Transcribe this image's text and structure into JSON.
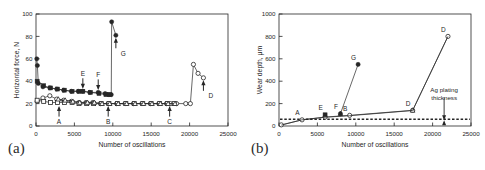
{
  "figure": {
    "panel_a_tag": "(a)",
    "panel_b_tag": "(b)"
  },
  "chart_data": [
    {
      "type": "line",
      "panel": "(a)",
      "title": "",
      "xlabel": "Number of oscillations",
      "ylabel": "Horizontal force, N",
      "xlim": [
        0,
        25000
      ],
      "ylim": [
        0,
        100
      ],
      "xticks": [
        0,
        5000,
        10000,
        15000,
        20000,
        25000
      ],
      "xticklabels": [
        "0",
        "5000",
        "10000",
        "15000",
        "20000",
        "25000"
      ],
      "yticks": [
        0,
        20,
        40,
        60,
        80,
        100
      ],
      "yticklabels": [
        "0",
        "20",
        "40",
        "60",
        "80",
        "100"
      ],
      "grid": false,
      "legend": "none",
      "annotations": [
        {
          "label": "A",
          "x": 3000,
          "y": 20,
          "arrow": "up"
        },
        {
          "label": "B",
          "x": 9400,
          "y": 20,
          "arrow": "up"
        },
        {
          "label": "C",
          "x": 17400,
          "y": 20,
          "arrow": "up"
        },
        {
          "label": "D",
          "x": 21800,
          "y": 43,
          "arrow": "up"
        },
        {
          "label": "E",
          "x": 6100,
          "y": 31,
          "arrow": "down"
        },
        {
          "label": "F",
          "x": 8100,
          "y": 30,
          "arrow": "down"
        },
        {
          "label": "G",
          "x": 10400,
          "y": 81,
          "arrow": "up"
        }
      ],
      "series": [
        {
          "name": "filled-circle-series",
          "marker": "filled-circle",
          "points": [
            [
              100,
              60
            ],
            [
              180,
              54
            ],
            [
              300,
              38
            ],
            [
              900,
              35
            ],
            [
              1800,
              34
            ],
            [
              2700,
              33
            ],
            [
              3600,
              32
            ],
            [
              4600,
              31
            ],
            [
              5500,
              31
            ],
            [
              6100,
              31
            ],
            [
              7000,
              30
            ],
            [
              8100,
              30
            ],
            [
              9000,
              29
            ],
            [
              9500,
              28
            ],
            [
              9800,
              28
            ],
            [
              9850,
              93
            ],
            [
              10400,
              81
            ]
          ]
        },
        {
          "name": "filled-square-series",
          "marker": "filled-square",
          "points": [
            [
              150,
              40
            ],
            [
              1000,
              36
            ],
            [
              1900,
              34
            ],
            [
              2800,
              33
            ],
            [
              3700,
              32
            ],
            [
              4700,
              31
            ],
            [
              5600,
              31
            ],
            [
              6100,
              31
            ],
            [
              7100,
              30
            ],
            [
              8200,
              29
            ],
            [
              9100,
              28
            ],
            [
              9600,
              28
            ]
          ]
        },
        {
          "name": "open-circle-series",
          "marker": "open-circle",
          "points": [
            [
              150,
              22
            ],
            [
              900,
              25
            ],
            [
              1800,
              27
            ],
            [
              2700,
              24
            ],
            [
              3600,
              23
            ],
            [
              4600,
              22
            ],
            [
              5600,
              21
            ],
            [
              6500,
              21
            ],
            [
              7400,
              21
            ],
            [
              8400,
              20
            ],
            [
              9400,
              20
            ],
            [
              10500,
              20
            ],
            [
              11600,
              20
            ],
            [
              12700,
              20
            ],
            [
              13800,
              20
            ],
            [
              14900,
              20
            ],
            [
              16000,
              20
            ],
            [
              17000,
              20
            ],
            [
              17500,
              20
            ],
            [
              18300,
              20
            ],
            [
              19500,
              20
            ],
            [
              20100,
              20
            ],
            [
              20500,
              55
            ],
            [
              21100,
              47
            ],
            [
              21800,
              43
            ]
          ]
        },
        {
          "name": "open-square-series",
          "marker": "open-square",
          "points": [
            [
              150,
              23
            ],
            [
              1000,
              22
            ],
            [
              1900,
              21
            ],
            [
              2800,
              21
            ],
            [
              3700,
              21
            ],
            [
              4700,
              21
            ],
            [
              5600,
              20
            ],
            [
              6600,
              20
            ],
            [
              7500,
              20
            ],
            [
              8500,
              20
            ],
            [
              9500,
              20
            ],
            [
              10600,
              20
            ],
            [
              11700,
              20
            ],
            [
              12800,
              20
            ],
            [
              13900,
              20
            ],
            [
              15000,
              20
            ],
            [
              16100,
              20
            ],
            [
              17100,
              20
            ],
            [
              18000,
              20
            ]
          ]
        },
        {
          "name": "open-triangle-series",
          "marker": "open-triangle",
          "points": [
            [
              2900,
              24
            ],
            [
              3800,
              23
            ],
            [
              4800,
              22
            ],
            [
              5700,
              21
            ],
            [
              6700,
              21
            ],
            [
              7600,
              21
            ],
            [
              8600,
              20
            ],
            [
              9600,
              20
            ],
            [
              10700,
              20
            ],
            [
              11800,
              20
            ],
            [
              12900,
              20
            ],
            [
              14000,
              20
            ],
            [
              15100,
              20
            ],
            [
              16200,
              20
            ],
            [
              17200,
              20
            ],
            [
              18100,
              20
            ]
          ]
        }
      ]
    },
    {
      "type": "line",
      "panel": "(b)",
      "title": "",
      "xlabel": "Number of oscillations",
      "ylabel": "Wear depth, μm",
      "xlim": [
        0,
        25000
      ],
      "ylim": [
        0,
        1000
      ],
      "xticks": [
        0,
        5000,
        10000,
        15000,
        20000,
        25000
      ],
      "xticklabels": [
        "0",
        "5000",
        "10000",
        "15000",
        "20000",
        "25000"
      ],
      "yticks": [
        0,
        200,
        400,
        600,
        800,
        1000
      ],
      "yticklabels": [
        "0",
        "200",
        "400",
        "600",
        "800",
        "1000"
      ],
      "grid": false,
      "legend": "none",
      "reference_line": {
        "label": "Ag plating thickness",
        "value": 60,
        "style": "dashed",
        "arrow": "down"
      },
      "annotations": [
        {
          "label": "A",
          "x": 3000,
          "y": 60
        },
        {
          "label": "E",
          "x": 6000,
          "y": 100
        },
        {
          "label": "F",
          "x": 8000,
          "y": 110
        },
        {
          "label": "B",
          "x": 9200,
          "y": 95
        },
        {
          "label": "G",
          "x": 10300,
          "y": 550
        },
        {
          "label": "D",
          "x": 17400,
          "y": 140
        },
        {
          "label": "D",
          "x": 22000,
          "y": 800
        }
      ],
      "series": [
        {
          "name": "open-circle-series",
          "marker": "open-circle",
          "points": [
            [
              300,
              10
            ],
            [
              3000,
              55
            ],
            [
              6000,
              80
            ],
            [
              9200,
              95
            ],
            [
              17400,
              140
            ],
            [
              22000,
              800
            ]
          ]
        },
        {
          "name": "filled-square-series",
          "marker": "filled-square",
          "points": [
            [
              6000,
              100
            ]
          ]
        },
        {
          "name": "filled-triangle-series",
          "marker": "filled-triangle",
          "points": [
            [
              8000,
              110
            ]
          ]
        },
        {
          "name": "filled-circle-series",
          "marker": "filled-circle",
          "points": [
            [
              8000,
              110
            ],
            [
              10300,
              550
            ]
          ]
        },
        {
          "name": "open-triangle-series",
          "marker": "open-triangle",
          "points": [
            [
              17400,
              140
            ]
          ]
        },
        {
          "name": "baseline-series",
          "marker": "none",
          "points": [
            [
              300,
              8
            ],
            [
              3000,
              55
            ],
            [
              6000,
              78
            ],
            [
              9200,
              92
            ],
            [
              17400,
              138
            ],
            [
              22000,
              800
            ]
          ]
        }
      ]
    }
  ]
}
